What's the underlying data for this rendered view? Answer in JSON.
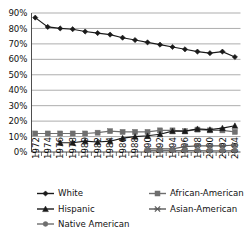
{
  "chart_data": {
    "type": "line",
    "title": "",
    "xlabel": "",
    "ylabel": "",
    "ylim": [
      0,
      90
    ],
    "ytick_labels": [
      "0%",
      "10%",
      "20%",
      "30%",
      "40%",
      "50%",
      "60%",
      "70%",
      "80%",
      "90%"
    ],
    "ytick_values": [
      0,
      10,
      20,
      30,
      40,
      50,
      60,
      70,
      80,
      90
    ],
    "grid": true,
    "legend_position": "bottom",
    "x": [
      1972,
      1973,
      1974,
      1975,
      1976,
      1977,
      1978,
      1979,
      1980,
      1981,
      1982,
      1983,
      1984,
      1985,
      1986,
      1987,
      1988,
      1989,
      1990,
      1991,
      1992,
      1993,
      1994,
      1995,
      1996,
      1997,
      1998,
      1999,
      2000,
      2001,
      2002,
      2003,
      2004
    ],
    "xtick_labels": [
      "1972",
      "1974",
      "1976",
      "1978",
      "1980",
      "1982",
      "1984",
      "1986",
      "1988",
      "1990",
      "1992",
      "1994",
      "1996",
      "1998",
      "2000",
      "2002",
      "2004"
    ],
    "xtick_values": [
      1972,
      1974,
      1976,
      1978,
      1980,
      1982,
      1984,
      1986,
      1988,
      1990,
      1992,
      1994,
      1996,
      1998,
      2000,
      2002,
      2004
    ],
    "series": [
      {
        "name": "White",
        "marker": "diamond",
        "color": "#1a1a1a",
        "x": [
          1972,
          1974,
          1976,
          1978,
          1980,
          1982,
          1984,
          1986,
          1988,
          1990,
          1992,
          1994,
          1996,
          1998,
          2000,
          2002,
          2004
        ],
        "values": [
          87,
          81,
          80,
          79.5,
          78,
          77,
          76,
          74,
          72.5,
          71,
          69.5,
          68,
          66.5,
          65,
          64,
          65,
          61.5
        ]
      },
      {
        "name": "African-American",
        "marker": "square",
        "color": "#6e6e6e",
        "x": [
          1972,
          1974,
          1976,
          1978,
          1980,
          1982,
          1984,
          1986,
          1988,
          1990,
          1992,
          1994,
          1996,
          1998,
          2000,
          2002,
          2004
        ],
        "values": [
          12,
          12,
          12,
          12,
          12,
          12.5,
          13.5,
          13,
          13,
          13,
          14,
          14,
          13.5,
          14.5,
          14,
          14,
          13
        ]
      },
      {
        "name": "Hispanic",
        "marker": "triangle",
        "color": "#1a1a1a",
        "x": [
          1976,
          1978,
          1980,
          1982,
          1984,
          1986,
          1988,
          1990,
          1992,
          1994,
          1996,
          1998,
          2000,
          2002,
          2004
        ],
        "values": [
          6,
          6,
          7,
          6.5,
          7,
          9,
          10,
          10.5,
          11.5,
          13.5,
          13.5,
          15,
          14.5,
          15.5,
          17
        ]
      },
      {
        "name": "Asian-American",
        "marker": "x",
        "color": "#5a5a5a",
        "x": [
          1990,
          1992,
          1994,
          1996,
          1998,
          2000,
          2002,
          2004
        ],
        "values": [
          2,
          2,
          2,
          3.5,
          4,
          4,
          4,
          4.5
        ]
      },
      {
        "name": "Native American",
        "marker": "circle",
        "color": "#6e6e6e",
        "x": [
          1990,
          1992,
          1994,
          1996,
          1998,
          2000,
          2002,
          2004
        ],
        "values": [
          1,
          1,
          1,
          1,
          1,
          0.8,
          0.8,
          1
        ]
      }
    ]
  }
}
